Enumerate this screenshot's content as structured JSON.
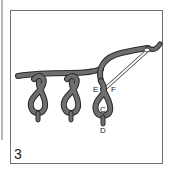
{
  "figure": {
    "step_number": "3",
    "point_labels": {
      "E": "E",
      "F": "F",
      "C": "C",
      "D": "D"
    },
    "colors": {
      "thread": "#6e6e6e",
      "thread_outline": "#2a2a2a",
      "needle": "#ffffff",
      "needle_outline": "#444444",
      "frame": "#707070"
    }
  }
}
